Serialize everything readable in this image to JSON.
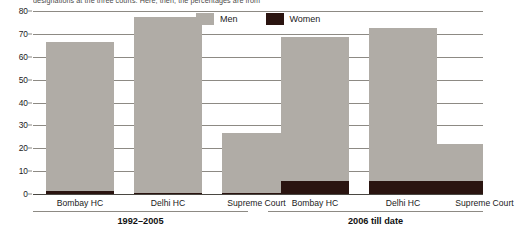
{
  "caption": "designations at the three courts. Here, then, the percentages are from",
  "legend": {
    "position": "top-center",
    "items": [
      {
        "name": "men-legend",
        "label": "Men",
        "color": "#b0aca6"
      },
      {
        "name": "women-legend",
        "label": "Women",
        "color": "#2a1410"
      }
    ]
  },
  "axis": {
    "ylabel": "",
    "xlabel": "",
    "yticks": [
      0,
      10,
      20,
      30,
      40,
      50,
      60,
      70,
      80
    ],
    "ylim": [
      0,
      80
    ],
    "grid": true
  },
  "groups": [
    {
      "name": "group-1992-2005",
      "label": "1992–2005"
    },
    {
      "name": "group-2006-till-date",
      "label": "2006 till date"
    }
  ],
  "chart_data": {
    "type": "bar",
    "title": "",
    "subtitle": "",
    "xlabel": "",
    "ylabel": "",
    "ylim": [
      0,
      80
    ],
    "yticks": [
      0,
      10,
      20,
      30,
      40,
      50,
      60,
      70,
      80
    ],
    "grid": true,
    "stacked": true,
    "legend_position": "top-center",
    "group_labels": [
      "1992–2005",
      "2006 till date"
    ],
    "categories": [
      "Bombay HC",
      "Delhi HC",
      "Supreme Court",
      "Bombay HC",
      "Delhi HC",
      "Supreme Court"
    ],
    "series": [
      {
        "name": "Men",
        "color": "#b0aca6",
        "values": [
          65,
          77,
          26,
          63,
          67,
          16.5
        ]
      },
      {
        "name": "Women",
        "color": "#2a1410",
        "values": [
          1.5,
          0.6,
          0.6,
          5.5,
          5.5,
          5.5
        ]
      }
    ],
    "totals": [
      66.5,
      77.6,
      26.6,
      68.5,
      72.5,
      22
    ],
    "annotations": []
  },
  "bars": [
    {
      "name": "bar-bombay-hc-1992-2005",
      "category": "Bombay HC",
      "group": "1992–2005",
      "men": 65,
      "women": 1.5,
      "total": 66.5,
      "left": 13,
      "width": 68
    },
    {
      "name": "bar-delhi-hc-1992-2005",
      "category": "Delhi HC",
      "group": "1992–2005",
      "men": 77,
      "women": 0.6,
      "total": 77.6,
      "left": 101,
      "width": 68
    },
    {
      "name": "bar-supreme-court-1992-2005",
      "category": "Supreme Court",
      "group": "1992–2005",
      "men": 26,
      "women": 0.6,
      "total": 26.6,
      "left": 189,
      "width": 68
    },
    {
      "name": "bar-bombay-hc-2006",
      "category": "Bombay HC",
      "group": "2006 till date",
      "men": 63,
      "women": 5.5,
      "total": 68.5,
      "left": 248,
      "width": 68
    },
    {
      "name": "bar-delhi-hc-2006",
      "category": "Delhi HC",
      "group": "2006 till date",
      "men": 67,
      "women": 5.5,
      "total": 72.5,
      "left": 336,
      "width": 68
    },
    {
      "name": "bar-supreme-court-2006",
      "category": "Supreme Court",
      "group": "2006 till date",
      "men": 16.5,
      "women": 5.5,
      "total": 22,
      "left": 382,
      "width": 68
    }
  ],
  "category_labels": [
    {
      "name": "catlabel-bombay-hc-1",
      "label": "Bombay HC",
      "left": 0,
      "width": 94
    },
    {
      "name": "catlabel-delhi-hc-1",
      "label": "Delhi HC",
      "left": 94,
      "width": 82
    },
    {
      "name": "catlabel-supreme-court-1",
      "label": "Supreme Court",
      "left": 176,
      "width": 95
    },
    {
      "name": "catlabel-bombay-hc-2",
      "label": "Bombay HC",
      "left": 235,
      "width": 94
    },
    {
      "name": "catlabel-delhi-hc-2",
      "label": "Delhi HC",
      "left": 329,
      "width": 82
    },
    {
      "name": "catlabel-supreme-court-2",
      "label": "Supreme Court",
      "left": 404,
      "width": 95
    }
  ]
}
